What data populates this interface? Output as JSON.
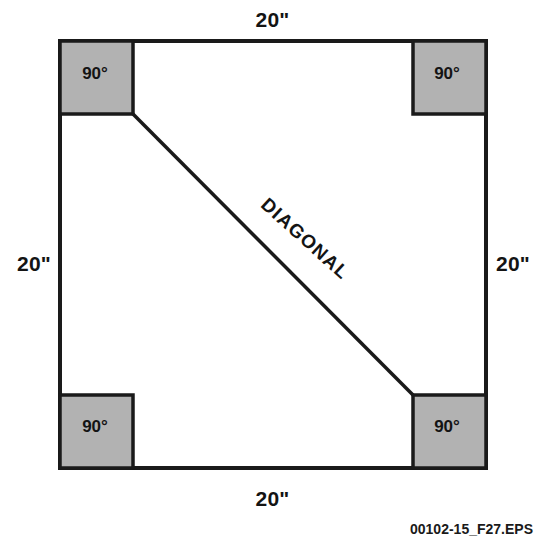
{
  "figure": {
    "shape": "square",
    "stroke_color": "#1a1a1a",
    "fill_color": "#ffffff",
    "corner_fill_color": "#b2b2b2",
    "dimensions": {
      "top": "20\"",
      "right": "20\"",
      "bottom": "20\"",
      "left": "20\""
    },
    "corner_angles": {
      "top_left": "90°",
      "top_right": "90°",
      "bottom_left": "90°",
      "bottom_right": "90°"
    },
    "diagonal_label": "DIAGONAL",
    "eps_id": "00102-15_F27.EPS"
  },
  "geometry": {
    "square": {
      "x": 60,
      "y": 41,
      "width": 426,
      "height": 427
    },
    "corner_box_size": 73,
    "diagonal": {
      "x1": 133,
      "y1": 114,
      "x2": 413,
      "y2": 395
    }
  }
}
